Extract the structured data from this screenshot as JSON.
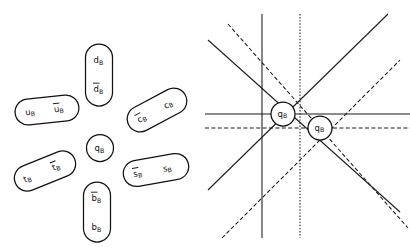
{
  "figure": {
    "background_color": "#ffffff",
    "ink_color": "#111111",
    "width": 410,
    "height": 249
  },
  "left_panel": {
    "name": "quark-capsule-cluster",
    "center": {
      "label": "q",
      "sub": "B",
      "bar": false,
      "cx": 100,
      "cy": 148,
      "r": 13.5
    },
    "capsules": [
      {
        "id": "up",
        "orientation": "horizontal",
        "cx": 47,
        "cy": 110,
        "w": 64,
        "h": 26,
        "rot": -6,
        "items": [
          {
            "label": "u",
            "sub": "B",
            "bar": false
          },
          {
            "label": "u",
            "sub": "B",
            "bar": true
          }
        ]
      },
      {
        "id": "down",
        "orientation": "vertical",
        "cx": 99,
        "cy": 75,
        "w": 27,
        "h": 62,
        "rot": 0,
        "items": [
          {
            "label": "d",
            "sub": "B",
            "bar": false
          },
          {
            "label": "d",
            "sub": "B",
            "bar": true
          }
        ]
      },
      {
        "id": "charm",
        "orientation": "diagonal",
        "cx": 157,
        "cy": 110,
        "w": 64,
        "h": 26,
        "rot": -28,
        "items": [
          {
            "label": "c",
            "sub": "B",
            "bar": true
          },
          {
            "label": "c",
            "sub": "B",
            "bar": false
          }
        ]
      },
      {
        "id": "strange",
        "orientation": "horizontal",
        "cx": 156,
        "cy": 170,
        "w": 66,
        "h": 26,
        "rot": -10,
        "items": [
          {
            "label": "s",
            "sub": "B",
            "bar": true
          },
          {
            "label": "s",
            "sub": "B",
            "bar": false
          }
        ]
      },
      {
        "id": "bottom",
        "orientation": "vertical",
        "cx": 97,
        "cy": 212,
        "w": 27,
        "h": 60,
        "rot": 0,
        "items": [
          {
            "label": "b",
            "sub": "B",
            "bar": true
          },
          {
            "label": "b",
            "sub": "B",
            "bar": false
          }
        ]
      },
      {
        "id": "top",
        "orientation": "diagonal",
        "cx": 45,
        "cy": 171,
        "w": 64,
        "h": 26,
        "rot": -22,
        "items": [
          {
            "label": "t",
            "sub": "B",
            "bar": false
          },
          {
            "label": "t",
            "sub": "B",
            "bar": true
          }
        ]
      }
    ]
  },
  "right_panel": {
    "name": "node-lattice",
    "nodes": [
      {
        "id": "node-left",
        "label": "q",
        "sub": "B",
        "cx": 283,
        "cy": 114,
        "r": 12
      },
      {
        "id": "node-right",
        "label": "q",
        "sub": "B",
        "cx": 320,
        "cy": 128,
        "r": 12
      }
    ],
    "line_styles": {
      "node_left": "solid",
      "node_right": "dashed"
    },
    "line_directions": [
      "horizontal",
      "vertical",
      "diagonal-down-right",
      "diagonal-up-right"
    ]
  }
}
